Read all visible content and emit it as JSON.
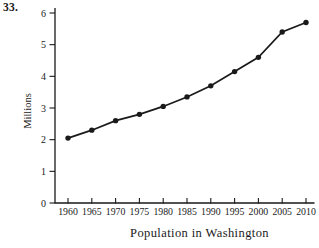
{
  "exercise_number": "33.",
  "chart_data": {
    "type": "line",
    "caption": "Population in Washington",
    "xlabel": "Population in Washington",
    "ylabel": "Millions",
    "categories": [
      "1960",
      "1965",
      "1970",
      "1975",
      "1980",
      "1985",
      "1990",
      "1995",
      "2000",
      "2005",
      "2010"
    ],
    "series": [
      {
        "name": "Population (millions)",
        "values": [
          2.05,
          2.3,
          2.6,
          2.8,
          3.05,
          3.35,
          3.7,
          4.15,
          4.6,
          5.4,
          5.7
        ]
      }
    ],
    "ylim": [
      0,
      6
    ],
    "ytick_step": 1,
    "grid": false,
    "legend": "none",
    "marker": "filled-circle",
    "line_color": "#1a1a1a",
    "axis_color": "#1a1a1a"
  }
}
